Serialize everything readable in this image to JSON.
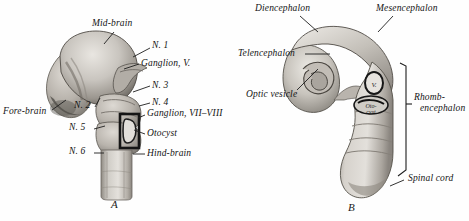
{
  "plate": {
    "background": "#fefefe",
    "ink": "#141414",
    "caption_font_style": "italic"
  },
  "figures": [
    {
      "id": "A",
      "letter": "A",
      "letter_pos": {
        "x": 111,
        "y": 200
      },
      "description": "dorsal view of embryonic brain and cranial nerves",
      "labels": [
        {
          "name": "mid-brain",
          "text": "Mid-brain",
          "x": 92,
          "y": 24,
          "align": "left"
        },
        {
          "name": "nerve-1",
          "text": "N. 1",
          "x": 152,
          "y": 45,
          "align": "left"
        },
        {
          "name": "ganglion-v",
          "text": "Ganglion, V.",
          "x": 141,
          "y": 64,
          "align": "left"
        },
        {
          "name": "nerve-3",
          "text": "N. 3",
          "x": 152,
          "y": 85,
          "align": "left"
        },
        {
          "name": "nerve-4",
          "text": "N. 4",
          "x": 152,
          "y": 102,
          "align": "left"
        },
        {
          "name": "ganglion-vii-viii",
          "text": "Ganglion, VII–VIII",
          "x": 147,
          "y": 113,
          "align": "left"
        },
        {
          "name": "otocyst",
          "text": "Otocyst",
          "x": 147,
          "y": 134,
          "align": "left"
        },
        {
          "name": "hind-brain",
          "text": "Hind-brain",
          "x": 147,
          "y": 153,
          "align": "left"
        },
        {
          "name": "fore-brain",
          "text": "Fore-brain",
          "x": 3,
          "y": 111,
          "align": "left"
        },
        {
          "name": "nerve-2",
          "text": "N. 2",
          "x": 76,
          "y": 105,
          "align": "left"
        },
        {
          "name": "nerve-5",
          "text": "N. 5",
          "x": 71,
          "y": 127,
          "align": "left"
        },
        {
          "name": "nerve-6",
          "text": "N. 6",
          "x": 71,
          "y": 151,
          "align": "left"
        }
      ]
    },
    {
      "id": "B",
      "letter": "B",
      "letter_pos": {
        "x": 348,
        "y": 203
      },
      "description": "lateral view of embryonic brain vesicles",
      "labels": [
        {
          "name": "diencephalon",
          "text": "Diencephalon",
          "x": 255,
          "y": 5,
          "align": "left"
        },
        {
          "name": "mesencephalon",
          "text": "Mesencephalon",
          "x": 376,
          "y": 5,
          "align": "left"
        },
        {
          "name": "telencephalon",
          "text": "Telencephalon",
          "x": 240,
          "y": 50,
          "align": "left"
        },
        {
          "name": "optic-vesicle",
          "text": "Optic vesicle",
          "x": 248,
          "y": 93,
          "align": "left"
        },
        {
          "name": "rhombencephalon",
          "text": "Rhomb-",
          "text2": "encephalon",
          "x": 416,
          "y": 97,
          "align": "left"
        },
        {
          "name": "spinal-cord",
          "text": "Spinal cord",
          "x": 408,
          "y": 177,
          "align": "left"
        }
      ],
      "bracket": {
        "name": "rhombencephalon-bracket",
        "x": 404,
        "y": 63,
        "height": 110
      }
    }
  ]
}
